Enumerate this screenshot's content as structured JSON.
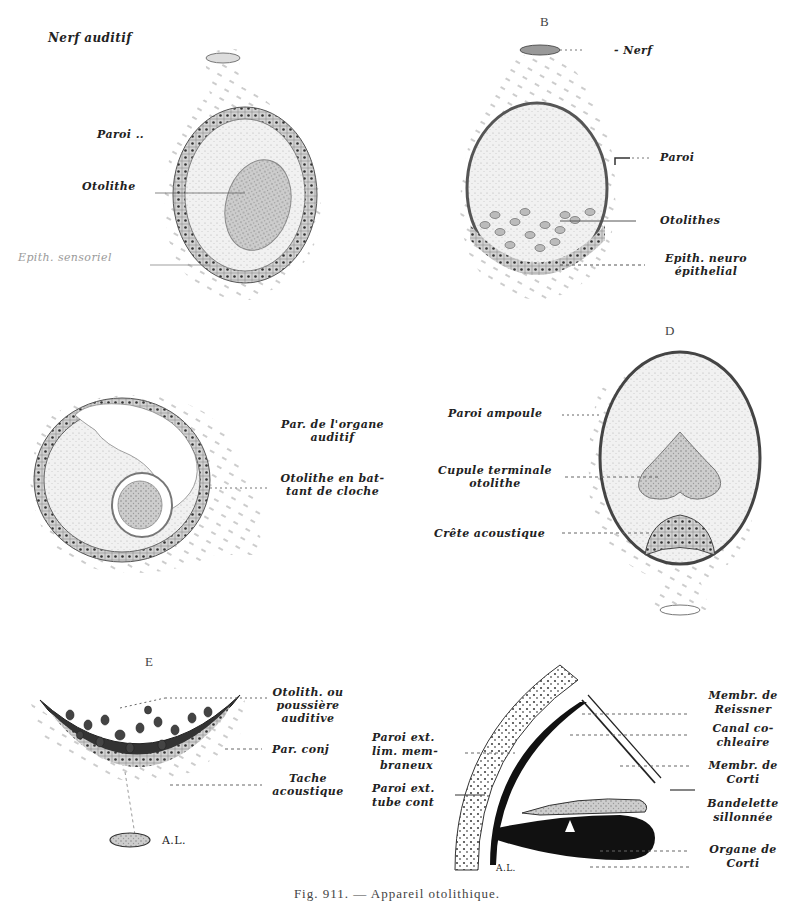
{
  "figure": {
    "caption": "Fig. 911. — Appareil otolithique.",
    "panels": {
      "A": {
        "letter": "",
        "labels": {
          "nerve": "Nerf auditif",
          "wall": "Paroi ..",
          "otolith": "Otolithe",
          "epithelium": "Epith. sensoriel"
        }
      },
      "B": {
        "letter": "B",
        "labels": {
          "nerve": "- Nerf",
          "wall": "Paroi",
          "otoliths": "Otolithes",
          "epithelium_line1": "Epith. neuro",
          "epithelium_line2": "épithelial"
        }
      },
      "C": {
        "letter": "",
        "labels": {
          "wall_line1": "Par. de l'organe",
          "wall_line2": "auditif",
          "otolith_line1": "Otolithe en bat-",
          "otolith_line2": "tant de cloche"
        }
      },
      "D": {
        "letter": "D",
        "labels": {
          "ampulla_wall": "Paroi ampoule",
          "cupula_line1": "Cupule terminale",
          "cupula_line2": "otolithe",
          "crest": "Crête acoustique"
        }
      },
      "E": {
        "letter": "E",
        "labels": {
          "otolith_line1": "Otolith. ou",
          "otolith_line2": "poussière",
          "otolith_line3": "auditive",
          "connective_wall": "Par. conj",
          "macula_line1": "Tache",
          "macula_line2": "acoustique",
          "nerve_mark": "A.L."
        }
      },
      "F": {
        "letter": "",
        "labels": {
          "outer_wall_membranous_line1": "Paroi ext.",
          "outer_wall_membranous_line2": "lim. mem-",
          "outer_wall_membranous_line3": "braneux",
          "outer_wall_tube_line1": "Paroi ext.",
          "outer_wall_tube_line2": "tube cont",
          "reissner_line1": "Membr. de",
          "reissner_line2": "Reissner",
          "canal_line1": "Canal co-",
          "canal_line2": "chleaire",
          "corti_membrane_line1": "Membr. de",
          "corti_membrane_line2": "Corti",
          "band_line1": "Bandelette",
          "band_line2": "sillonnée",
          "corti_organ_line1": "Organe de",
          "corti_organ_line2": "Corti",
          "mark": "A.L."
        }
      }
    },
    "colors": {
      "ink": "#1c1c1c",
      "stipple": "#b8b8b8",
      "fill_light": "#ececec",
      "fill_mid": "#cfcfcf",
      "fill_dark": "#8a8a8a",
      "paper": "#ffffff"
    }
  }
}
